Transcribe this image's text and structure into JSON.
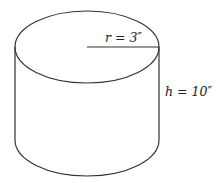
{
  "diagram": {
    "shape": "cylinder",
    "radius_label": "r = 3″",
    "height_label": "h = 10″",
    "stroke_color": "#333333",
    "background": "#ffffff"
  }
}
